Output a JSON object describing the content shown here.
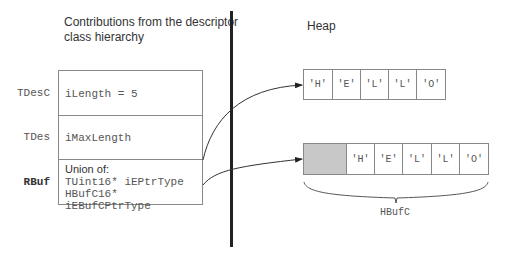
{
  "left_section": {
    "title_line1": "Contributions from the descriptor",
    "title_line2": "class hierarchy",
    "rows": [
      {
        "class_name": "TDesC",
        "fields": [
          "iLength = 5"
        ]
      },
      {
        "class_name": "TDes",
        "fields": [
          "iMaxLength"
        ]
      },
      {
        "class_name": "RBuf",
        "heading": "Union of:",
        "fields": [
          "TUint16* iEPtrType",
          "HBufC16* iEBufCPtrType"
        ]
      }
    ]
  },
  "right_section": {
    "title": "Heap",
    "top_array": {
      "cells": [
        "'H'",
        "'E'",
        "'L'",
        "'L'",
        "'O'"
      ]
    },
    "bottom_array": {
      "header_shaded": true,
      "cells": [
        "'H'",
        "'E'",
        "'L'",
        "'L'",
        "'O'"
      ],
      "brace_label": "HBufC"
    }
  },
  "colors": {
    "divider": "#222222",
    "border": "#888888",
    "shaded_cell": "#c8c8c8",
    "text": "#333333"
  }
}
